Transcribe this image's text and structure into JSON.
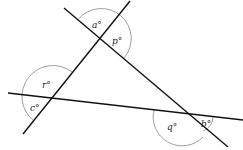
{
  "diagram": {
    "type": "geometry-angles",
    "labels": {
      "a": "a°",
      "p": "p°",
      "r": "r°",
      "c": "c°",
      "q": "q°",
      "b": "b°"
    },
    "colors": {
      "line": "#111111",
      "arc": "#888888",
      "background": "#ffffff"
    }
  }
}
